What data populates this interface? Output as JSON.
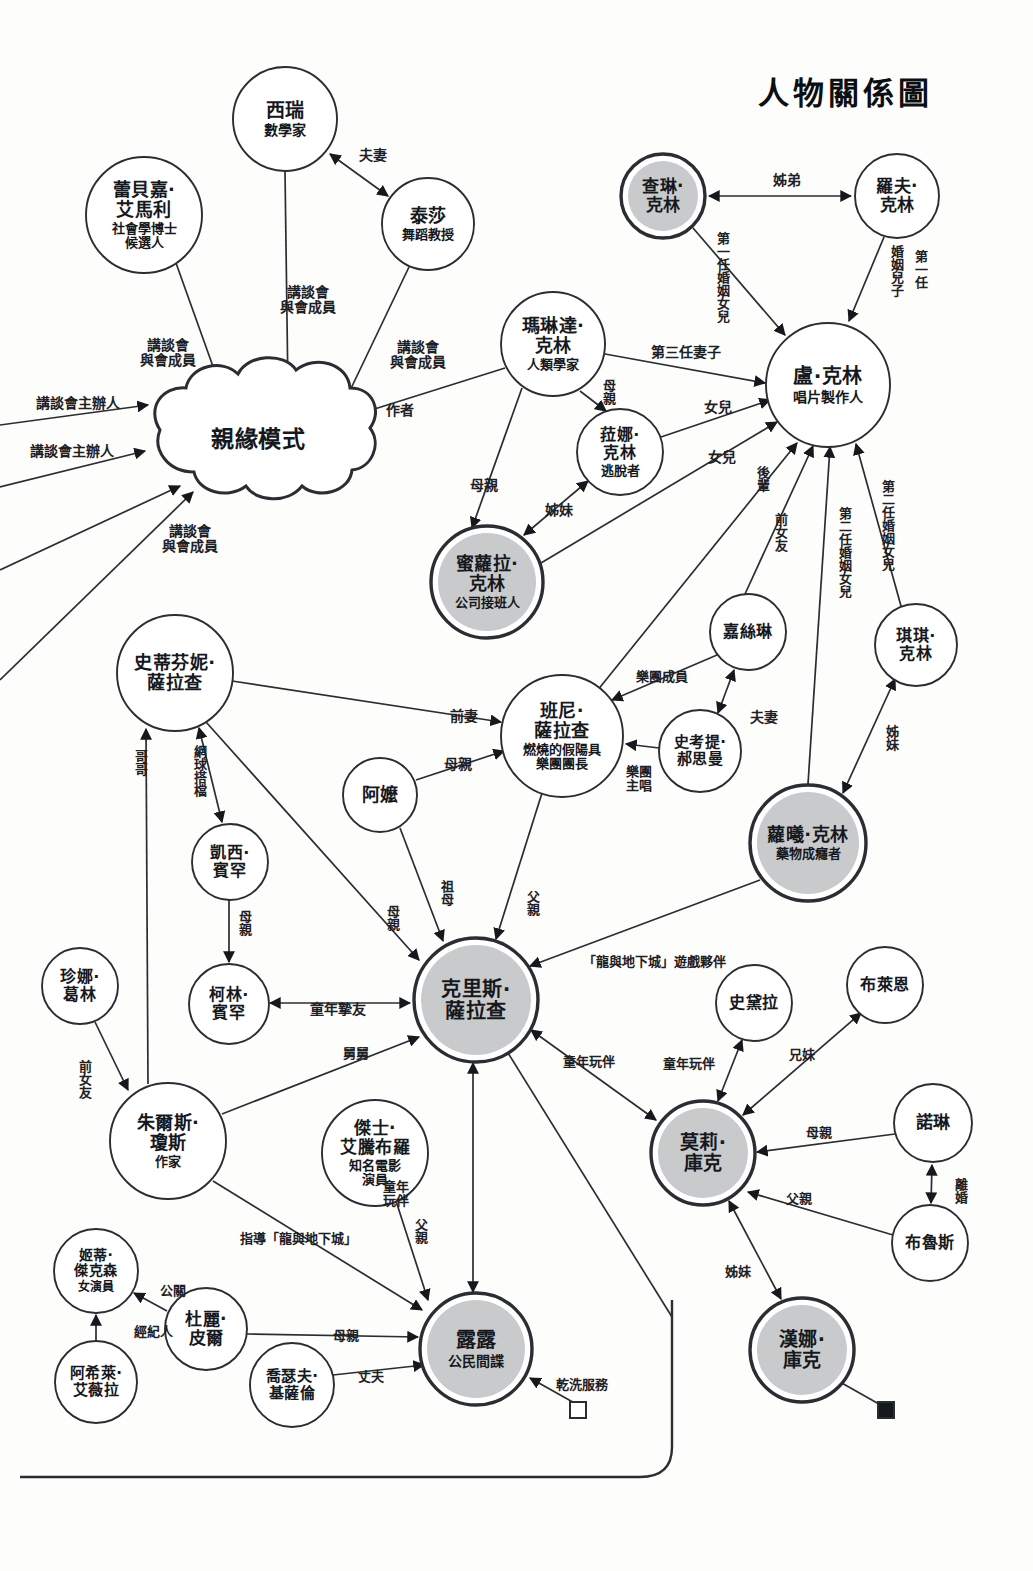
{
  "title": "人物關係圖",
  "nodes": [
    {
      "id": "xirui",
      "name": "西瑞",
      "sub": "數學家",
      "cx": 285,
      "cy": 119,
      "r": 52,
      "style": "plain",
      "fs": 19,
      "subfs": 14
    },
    {
      "id": "leibeijia",
      "name": "蕾貝嘉·\n艾馬利",
      "sub": "社會學博士\n候選人",
      "cx": 144,
      "cy": 215,
      "r": 58,
      "style": "plain",
      "fs": 18,
      "subfs": 13
    },
    {
      "id": "taisha",
      "name": "泰莎",
      "sub": "舞蹈教授",
      "cx": 428,
      "cy": 224,
      "r": 46,
      "style": "plain",
      "fs": 18,
      "subfs": 13
    },
    {
      "id": "malinda",
      "name": "瑪琳達·\n克林",
      "sub": "人類學家",
      "cx": 553,
      "cy": 344,
      "r": 52,
      "style": "plain",
      "fs": 18,
      "subfs": 13
    },
    {
      "id": "chalin",
      "name": "查琳·\n克林",
      "sub": "",
      "cx": 663,
      "cy": 196,
      "r": 42,
      "style": "thick-fill",
      "fs": 17,
      "subfs": 13
    },
    {
      "id": "luofu",
      "name": "羅夫·\n克林",
      "sub": "",
      "cx": 897,
      "cy": 196,
      "r": 42,
      "style": "plain",
      "fs": 17,
      "subfs": 13
    },
    {
      "id": "lukelin",
      "name": "盧·克林",
      "sub": "唱片製作人",
      "cx": 828,
      "cy": 385,
      "r": 62,
      "style": "plain",
      "fs": 20,
      "subfs": 14
    },
    {
      "id": "lana",
      "name": "菈娜·\n克林",
      "sub": "逃脫者",
      "cx": 620,
      "cy": 452,
      "r": 43,
      "style": "plain",
      "fs": 16,
      "subfs": 13
    },
    {
      "id": "miluola",
      "name": "蜜蘿拉·\n克林",
      "sub": "公司接班人",
      "cx": 487,
      "cy": 582,
      "r": 56,
      "style": "thick-fill",
      "fs": 18,
      "subfs": 13
    },
    {
      "id": "qiqi",
      "name": "琪琪·\n克林",
      "sub": "",
      "cx": 916,
      "cy": 645,
      "r": 41,
      "style": "plain",
      "fs": 16,
      "subfs": 13
    },
    {
      "id": "jiasilin",
      "name": "嘉絲琳",
      "sub": "",
      "cx": 748,
      "cy": 632,
      "r": 38,
      "style": "plain",
      "fs": 16,
      "subfs": 13
    },
    {
      "id": "shikaoti",
      "name": "史考提·\n郝思曼",
      "sub": "",
      "cx": 700,
      "cy": 751,
      "r": 41,
      "style": "plain",
      "fs": 15,
      "subfs": 13
    },
    {
      "id": "luoxi",
      "name": "蘿曦·克林",
      "sub": "藥物成癮者",
      "cx": 808,
      "cy": 843,
      "r": 58,
      "style": "thick-fill",
      "fs": 18,
      "subfs": 13
    },
    {
      "id": "shidifenni",
      "name": "史蒂芬妮·\n薩拉查",
      "sub": "",
      "cx": 175,
      "cy": 673,
      "r": 58,
      "style": "plain",
      "fs": 18,
      "subfs": 13
    },
    {
      "id": "banni",
      "name": "班尼·\n薩拉查",
      "sub": "燃燒的假陽具\n樂團團長",
      "cx": 562,
      "cy": 736,
      "r": 61,
      "style": "plain",
      "fs": 18,
      "subfs": 13
    },
    {
      "id": "ama",
      "name": "阿嬤",
      "sub": "",
      "cx": 380,
      "cy": 795,
      "r": 37,
      "style": "plain",
      "fs": 18,
      "subfs": 13
    },
    {
      "id": "kaixi",
      "name": "凱西·\n賓罕",
      "sub": "",
      "cx": 230,
      "cy": 862,
      "r": 38,
      "style": "plain",
      "fs": 16,
      "subfs": 13
    },
    {
      "id": "zhenna",
      "name": "珍娜·\n葛林",
      "sub": "",
      "cx": 80,
      "cy": 986,
      "r": 38,
      "style": "plain",
      "fs": 16,
      "subfs": 13
    },
    {
      "id": "kelin",
      "name": "柯林·\n賓罕",
      "sub": "",
      "cx": 229,
      "cy": 1004,
      "r": 40,
      "style": "plain",
      "fs": 16,
      "subfs": 13
    },
    {
      "id": "kelisi",
      "name": "克里斯·\n薩拉查",
      "sub": "",
      "cx": 476,
      "cy": 1000,
      "r": 62,
      "style": "thick-fill",
      "fs": 20,
      "subfs": 14
    },
    {
      "id": "zhuersi",
      "name": "朱爾斯·\n瓊斯",
      "sub": "作家",
      "cx": 168,
      "cy": 1141,
      "r": 58,
      "style": "plain",
      "fs": 18,
      "subfs": 13
    },
    {
      "id": "jieshi",
      "name": "傑士·\n艾騰布羅",
      "sub": "知名電影\n演員",
      "cx": 375,
      "cy": 1153,
      "r": 53,
      "style": "plain",
      "fs": 17,
      "subfs": 13
    },
    {
      "id": "jidi",
      "name": "姬蒂·\n傑克森",
      "sub": "女演員",
      "cx": 96,
      "cy": 1271,
      "r": 42,
      "style": "plain",
      "fs": 14,
      "subfs": 12
    },
    {
      "id": "duli",
      "name": "杜麗·\n皮爾",
      "sub": "",
      "cx": 206,
      "cy": 1329,
      "r": 41,
      "style": "plain",
      "fs": 17,
      "subfs": 13
    },
    {
      "id": "axilai",
      "name": "阿希萊·\n艾薇拉",
      "sub": "",
      "cx": 96,
      "cy": 1382,
      "r": 41,
      "style": "plain",
      "fs": 15,
      "subfs": 13
    },
    {
      "id": "qiaosefu",
      "name": "喬瑟夫·\n基薩倫",
      "sub": "",
      "cx": 292,
      "cy": 1385,
      "r": 42,
      "style": "plain",
      "fs": 15,
      "subfs": 13
    },
    {
      "id": "lulu",
      "name": "露露",
      "sub": "公民間諜",
      "cx": 476,
      "cy": 1349,
      "r": 56,
      "style": "thick-fill",
      "fs": 20,
      "subfs": 14
    },
    {
      "id": "shidaila",
      "name": "史黛拉",
      "sub": "",
      "cx": 754,
      "cy": 1003,
      "r": 38,
      "style": "plain",
      "fs": 16,
      "subfs": 13
    },
    {
      "id": "bulaien",
      "name": "布萊恩",
      "sub": "",
      "cx": 885,
      "cy": 985,
      "r": 38,
      "style": "plain",
      "fs": 16,
      "subfs": 13
    },
    {
      "id": "moli",
      "name": "莫莉·\n庫克",
      "sub": "",
      "cx": 703,
      "cy": 1153,
      "r": 52,
      "style": "thick-fill",
      "fs": 19,
      "subfs": 13
    },
    {
      "id": "nuolin",
      "name": "諾琳",
      "sub": "",
      "cx": 933,
      "cy": 1123,
      "r": 39,
      "style": "plain",
      "fs": 17,
      "subfs": 13
    },
    {
      "id": "bulusi",
      "name": "布魯斯",
      "sub": "",
      "cx": 930,
      "cy": 1243,
      "r": 38,
      "style": "plain",
      "fs": 16,
      "subfs": 13
    },
    {
      "id": "hanna",
      "name": "漢娜·\n庫克",
      "sub": "",
      "cx": 802,
      "cy": 1350,
      "r": 52,
      "style": "thick-fill",
      "fs": 19,
      "subfs": 13
    }
  ],
  "cloud": {
    "label": "親緣模式",
    "cx": 258,
    "cy": 440,
    "fs": 23
  },
  "edge_labels": [
    {
      "id": "el-fuqi",
      "text": "夫妻",
      "x": 359,
      "y": 148,
      "vertical": false,
      "fs": 14
    },
    {
      "id": "el-jiangtan-member-1",
      "text": "講談會\n與會成員",
      "x": 280,
      "y": 285,
      "vertical": false,
      "fs": 14
    },
    {
      "id": "el-jiangtan-member-2",
      "text": "講談會\n與會成員",
      "x": 140,
      "y": 338,
      "vertical": false,
      "fs": 14
    },
    {
      "id": "el-jiangtan-member-3",
      "text": "講談會\n與會成員",
      "x": 390,
      "y": 340,
      "vertical": false,
      "fs": 14
    },
    {
      "id": "el-jiangtan-host-1",
      "text": "講談會主辦人",
      "x": 36,
      "y": 396,
      "vertical": false,
      "fs": 14
    },
    {
      "id": "el-jiangtan-host-2",
      "text": "講談會主辦人",
      "x": 30,
      "y": 444,
      "vertical": false,
      "fs": 14
    },
    {
      "id": "el-jiangtan-member-4",
      "text": "講談會\n與會成員",
      "x": 162,
      "y": 524,
      "vertical": false,
      "fs": 14
    },
    {
      "id": "el-zuozhe",
      "text": "作者",
      "x": 386,
      "y": 403,
      "vertical": false,
      "fs": 14
    },
    {
      "id": "el-zimei-sister",
      "text": "姊弟",
      "x": 773,
      "y": 173,
      "vertical": false,
      "fs": 14
    },
    {
      "id": "el-first-marriage-daughter",
      "text": "第一任婚姻女兒",
      "x": 715,
      "y": 232,
      "vertical": true,
      "fs": 13
    },
    {
      "id": "el-first-marriage-son",
      "text": "婚姻兒子",
      "x": 889,
      "y": 245,
      "vertical": true,
      "fs": 13
    },
    {
      "id": "el-first-marriage-son2",
      "text": "第一任",
      "x": 913,
      "y": 250,
      "vertical": true,
      "fs": 13
    },
    {
      "id": "el-third-wife",
      "text": "第三任妻子",
      "x": 651,
      "y": 345,
      "vertical": false,
      "fs": 14
    },
    {
      "id": "el-muqin-lana",
      "text": "母親",
      "x": 601,
      "y": 379,
      "vertical": true,
      "fs": 13
    },
    {
      "id": "el-nuer-1",
      "text": "女兒",
      "x": 704,
      "y": 400,
      "vertical": false,
      "fs": 14
    },
    {
      "id": "el-nuer-2",
      "text": "女兒",
      "x": 708,
      "y": 450,
      "vertical": false,
      "fs": 14
    },
    {
      "id": "el-muqin-milo",
      "text": "母親",
      "x": 470,
      "y": 478,
      "vertical": false,
      "fs": 14
    },
    {
      "id": "el-zimei-sisters",
      "text": "姊妹",
      "x": 545,
      "y": 503,
      "vertical": false,
      "fs": 14
    },
    {
      "id": "el-houbei",
      "text": "後輩",
      "x": 755,
      "y": 466,
      "vertical": true,
      "fs": 13
    },
    {
      "id": "el-qiannvyou",
      "text": "前女友",
      "x": 773,
      "y": 513,
      "vertical": true,
      "fs": 13
    },
    {
      "id": "el-second-marriage-daughter",
      "text": "第二任婚姻女兒",
      "x": 837,
      "y": 507,
      "vertical": true,
      "fs": 13
    },
    {
      "id": "el-second-marriage-daughter2",
      "text": "第二任婚姻女兒",
      "x": 880,
      "y": 480,
      "vertical": true,
      "fs": 13
    },
    {
      "id": "el-band-member",
      "text": "樂團成員",
      "x": 636,
      "y": 670,
      "vertical": false,
      "fs": 13
    },
    {
      "id": "el-fuqi-2",
      "text": "夫妻",
      "x": 750,
      "y": 710,
      "vertical": false,
      "fs": 14
    },
    {
      "id": "el-band-singer",
      "text": "樂團\n主唱",
      "x": 626,
      "y": 765,
      "vertical": false,
      "fs": 13
    },
    {
      "id": "el-zimei-qiqi",
      "text": "姊妹",
      "x": 884,
      "y": 725,
      "vertical": true,
      "fs": 13
    },
    {
      "id": "el-qianqi",
      "text": "前妻",
      "x": 450,
      "y": 709,
      "vertical": false,
      "fs": 14
    },
    {
      "id": "el-gege",
      "text": "哥哥",
      "x": 133,
      "y": 750,
      "vertical": true,
      "fs": 13
    },
    {
      "id": "el-tennis",
      "text": "網球搭檔",
      "x": 192,
      "y": 745,
      "vertical": true,
      "fs": 13
    },
    {
      "id": "el-muqin-banni",
      "text": "母親",
      "x": 444,
      "y": 757,
      "vertical": false,
      "fs": 14
    },
    {
      "id": "el-zumu",
      "text": "祖母",
      "x": 439,
      "y": 880,
      "vertical": true,
      "fs": 13
    },
    {
      "id": "el-muqin-kelisi",
      "text": "母親",
      "x": 385,
      "y": 905,
      "vertical": true,
      "fs": 13
    },
    {
      "id": "el-fuqin-banni",
      "text": "父親",
      "x": 525,
      "y": 890,
      "vertical": true,
      "fs": 13
    },
    {
      "id": "el-muqin-kelin",
      "text": "母親",
      "x": 237,
      "y": 910,
      "vertical": true,
      "fs": 13
    },
    {
      "id": "el-dnd-partner",
      "text": "「龍與地下城」遊戲夥伴",
      "x": 583,
      "y": 955,
      "vertical": false,
      "fs": 13
    },
    {
      "id": "el-childhood-bestfriend",
      "text": "童年摯友",
      "x": 310,
      "y": 1002,
      "vertical": false,
      "fs": 14
    },
    {
      "id": "el-jiujiu",
      "text": "舅舅",
      "x": 343,
      "y": 1047,
      "vertical": false,
      "fs": 13
    },
    {
      "id": "el-qiannvyou-2",
      "text": "前女友",
      "x": 77,
      "y": 1060,
      "vertical": true,
      "fs": 13
    },
    {
      "id": "el-childhood-playmate-1",
      "text": "童年玩伴",
      "x": 563,
      "y": 1055,
      "vertical": false,
      "fs": 13
    },
    {
      "id": "el-childhood-playmate-2",
      "text": "童年玩伴",
      "x": 663,
      "y": 1057,
      "vertical": false,
      "fs": 13
    },
    {
      "id": "el-xiongmei",
      "text": "兄妹",
      "x": 789,
      "y": 1048,
      "vertical": false,
      "fs": 13
    },
    {
      "id": "el-muqin-moli",
      "text": "母親",
      "x": 806,
      "y": 1126,
      "vertical": false,
      "fs": 13
    },
    {
      "id": "el-nuolin-divorce",
      "text": "離婚",
      "x": 953,
      "y": 1178,
      "vertical": true,
      "fs": 13
    },
    {
      "id": "el-fuqin-moli",
      "text": "父親",
      "x": 786,
      "y": 1192,
      "vertical": false,
      "fs": 13
    },
    {
      "id": "el-childhood-playmate-3",
      "text": "童年\n玩伴",
      "x": 383,
      "y": 1180,
      "vertical": false,
      "fs": 13
    },
    {
      "id": "el-fuqin-jieshi",
      "text": "父親",
      "x": 413,
      "y": 1218,
      "vertical": true,
      "fs": 13
    },
    {
      "id": "el-guide-dnd",
      "text": "指導「龍與地下城」",
      "x": 240,
      "y": 1232,
      "vertical": false,
      "fs": 13
    },
    {
      "id": "el-gongguan",
      "text": "公關",
      "x": 160,
      "y": 1284,
      "vertical": false,
      "fs": 13
    },
    {
      "id": "el-jingjiren",
      "text": "經紀人",
      "x": 134,
      "y": 1325,
      "vertical": false,
      "fs": 13
    },
    {
      "id": "el-muqin-lulu",
      "text": "母親",
      "x": 333,
      "y": 1329,
      "vertical": false,
      "fs": 13
    },
    {
      "id": "el-zhangfu",
      "text": "丈夫",
      "x": 358,
      "y": 1370,
      "vertical": false,
      "fs": 13
    },
    {
      "id": "el-zimei-hanna",
      "text": "姊妹",
      "x": 725,
      "y": 1265,
      "vertical": false,
      "fs": 13
    },
    {
      "id": "el-drycleaning",
      "text": "乾洗服務",
      "x": 556,
      "y": 1378,
      "vertical": false,
      "fs": 13
    }
  ],
  "colors": {
    "ink": "#15181c",
    "node_fill": "#c9cacb",
    "stroke": "#2a2d31",
    "paper": "#fdfdfb"
  },
  "markers": [
    {
      "id": "marker-open-square",
      "x": 578,
      "y": 1410,
      "filled": false
    },
    {
      "id": "marker-filled-square",
      "x": 886,
      "y": 1410,
      "filled": true
    }
  ]
}
